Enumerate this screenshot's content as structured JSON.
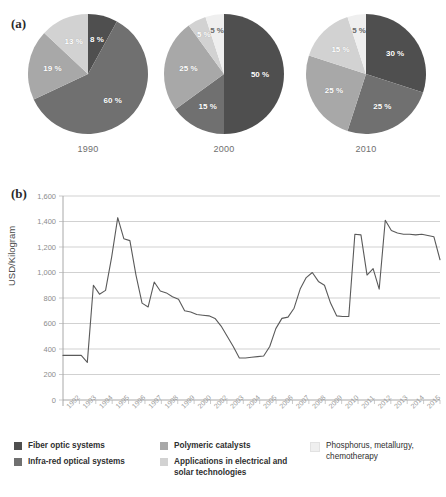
{
  "figure": {
    "panel_a_label": "(a)",
    "panel_b_label": "(b)"
  },
  "chart_data": [
    {
      "type": "pie",
      "title": "1990",
      "year": "1990",
      "labels": [
        "Fiber optic systems",
        "Infra-red optical systems",
        "Polymeric catalysts",
        "Applications in electrical and solar technologies"
      ],
      "categories": [
        "Fiber optic systems",
        "Infra-red optical systems",
        "Polymeric catalysts",
        "Applications in electrical and solar technologies",
        "Phosphorus, metallurgy, chemotherapy"
      ],
      "values": [
        8,
        60,
        19,
        13,
        0
      ],
      "data_labels": [
        "8 %",
        "60 %",
        "19 %",
        "13 %"
      ],
      "colors": [
        "#4f4f4f",
        "#707070",
        "#a8a8a8",
        "#d2d2d2",
        "#efefef"
      ],
      "legend_position": "bottom"
    },
    {
      "type": "pie",
      "title": "2000",
      "year": "2000",
      "labels": [
        "Fiber optic systems",
        "Infra-red optical systems",
        "Polymeric catalysts",
        "Applications in electrical and solar technologies",
        "Phosphorus, metallurgy, chemotherapy"
      ],
      "categories": [
        "Fiber optic systems",
        "Infra-red optical systems",
        "Polymeric catalysts",
        "Applications in electrical and solar technologies",
        "Phosphorus, metallurgy, chemotherapy"
      ],
      "values": [
        50,
        15,
        25,
        5,
        5
      ],
      "data_labels": [
        "50 %",
        "15 %",
        "25 %",
        "5 %",
        "5 %"
      ],
      "colors": [
        "#4f4f4f",
        "#707070",
        "#a8a8a8",
        "#d2d2d2",
        "#efefef"
      ],
      "legend_position": "bottom"
    },
    {
      "type": "pie",
      "title": "2010",
      "year": "2010",
      "labels": [
        "Fiber optic systems",
        "Infra-red optical systems",
        "Polymeric catalysts",
        "Applications in electrical and solar technologies",
        "Phosphorus, metallurgy, chemotherapy"
      ],
      "categories": [
        "Fiber optic systems",
        "Infra-red optical systems",
        "Polymeric catalysts",
        "Applications in electrical and solar technologies",
        "Phosphorus, metallurgy, chemotherapy"
      ],
      "values": [
        30,
        25,
        25,
        15,
        5
      ],
      "data_labels": [
        "30 %",
        "25 %",
        "25 %",
        "15 %",
        "5 %"
      ],
      "colors": [
        "#4f4f4f",
        "#707070",
        "#a8a8a8",
        "#d2d2d2",
        "#efefef"
      ],
      "legend_position": "bottom"
    },
    {
      "type": "line",
      "title": "",
      "xlabel": "",
      "ylabel": "USD/Kilogram",
      "ylim": [
        0,
        1600
      ],
      "yticks": [
        0,
        200,
        400,
        600,
        800,
        1000,
        1200,
        1400,
        1600
      ],
      "ytick_labels": [
        "0",
        "200",
        "400",
        "600",
        "800",
        "1,000",
        "1,200",
        "1,400",
        "1,600"
      ],
      "grid": true,
      "legend_position": "none",
      "line_color": "#5a5a5a",
      "x": [
        "1992",
        "1993",
        "1994",
        "1995",
        "1996",
        "1997",
        "1998",
        "1999",
        "2000",
        "2002",
        "2003",
        "2004",
        "2005",
        "2006",
        "2007",
        "2008",
        "2009",
        "2010",
        "2011",
        "2012",
        "2013",
        "2014",
        "2015"
      ],
      "xtick_labels": [
        "1992",
        "1993",
        "1994",
        "1995",
        "1996",
        "1997",
        "1998",
        "1999",
        "2000",
        "2002",
        "2003",
        "2004",
        "2005",
        "2006",
        "2007",
        "2008",
        "2009",
        "2010",
        "2011",
        "2012",
        "2013",
        "2014",
        "2015"
      ],
      "series": [
        {
          "name": "Rare earth price",
          "values": [
            350,
            350,
            350,
            350,
            295,
            900,
            830,
            860,
            1120,
            1430,
            1265,
            1250,
            980,
            760,
            730,
            925,
            855,
            840,
            810,
            790,
            700,
            690,
            670,
            665,
            660,
            640,
            580,
            500,
            420,
            330,
            330,
            335,
            340,
            345,
            420,
            560,
            640,
            650,
            720,
            870,
            960,
            1000,
            930,
            900,
            760,
            660,
            655,
            655,
            1300,
            1295,
            980,
            1030,
            870,
            1410,
            1330,
            1310,
            1300,
            1300,
            1295,
            1300,
            1290,
            1280,
            1100
          ]
        }
      ]
    }
  ],
  "legend": {
    "columns": [
      {
        "items": [
          {
            "label": "Fiber optic systems",
            "color": "#4f4f4f"
          },
          {
            "label": "Infra-red optical systems",
            "color": "#707070"
          }
        ]
      },
      {
        "items": [
          {
            "label": "Polymeric catalysts",
            "color": "#a8a8a8"
          },
          {
            "label": "Applications in electrical and solar technologies",
            "color": "#d2d2d2"
          }
        ]
      },
      {
        "items": [
          {
            "label": "Phosphorus, metallurgy, chemotherapy",
            "color": "#efefef"
          }
        ]
      }
    ]
  }
}
